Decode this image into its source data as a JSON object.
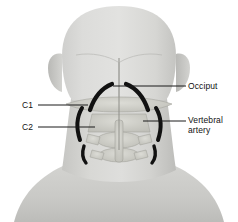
{
  "figure": {
    "type": "anatomical-illustration",
    "view": "posterior",
    "background_color": "#ffffff"
  },
  "palette": {
    "background": "#ffffff",
    "skin_light": "#dededd",
    "skin_mid": "#c9c9c7",
    "skin_shadow": "#b4b4b1",
    "bone_light": "#d7d7d2",
    "bone_mid": "#c2c2bb",
    "bone_outline": "#9a9a92",
    "artery": "#111111",
    "leader_line": "#1a1a1a",
    "label_text": "#111111"
  },
  "labels": [
    {
      "id": "occiput",
      "text": "Occiput",
      "side": "right"
    },
    {
      "id": "vertebral",
      "text": "Vertebral\nartery",
      "side": "right"
    },
    {
      "id": "c1",
      "text": "C1",
      "side": "left"
    },
    {
      "id": "c2",
      "text": "C2",
      "side": "left"
    }
  ],
  "structures": [
    {
      "name": "occiput",
      "kind": "bone"
    },
    {
      "name": "atlas-c1",
      "kind": "bone"
    },
    {
      "name": "axis-c2",
      "kind": "bone"
    },
    {
      "name": "cervical-vertebrae",
      "kind": "bone"
    },
    {
      "name": "vertebral-artery-left",
      "kind": "vessel"
    },
    {
      "name": "vertebral-artery-right",
      "kind": "vessel"
    },
    {
      "name": "ear-left",
      "kind": "soft"
    },
    {
      "name": "ear-right",
      "kind": "soft"
    },
    {
      "name": "trapezius",
      "kind": "soft"
    }
  ]
}
